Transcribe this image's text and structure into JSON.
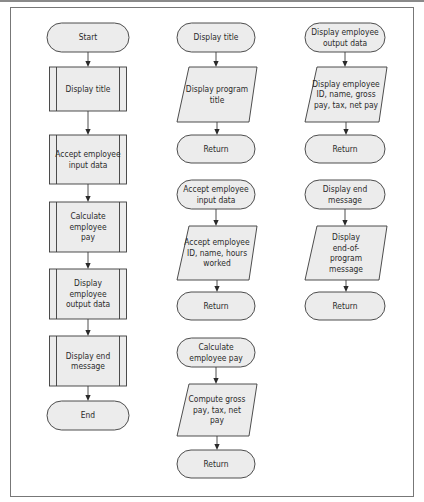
{
  "diagram": {
    "type": "flowchart",
    "columns": [
      {
        "name": "main-program",
        "nodes": [
          {
            "id": "start",
            "kind": "terminal",
            "lines": [
              "Start"
            ]
          },
          {
            "id": "main-display-title",
            "kind": "predefined-process",
            "lines": [
              "Display title"
            ]
          },
          {
            "id": "main-accept-input",
            "kind": "predefined-process",
            "lines": [
              "Accept employee",
              "input data"
            ]
          },
          {
            "id": "main-calculate-pay",
            "kind": "predefined-process",
            "lines": [
              "Calculate",
              "employee",
              "pay"
            ]
          },
          {
            "id": "main-display-output",
            "kind": "predefined-process",
            "lines": [
              "Display",
              "employee",
              "output data"
            ]
          },
          {
            "id": "main-display-end",
            "kind": "predefined-process",
            "lines": [
              "Display end",
              "message"
            ]
          },
          {
            "id": "end",
            "kind": "terminal",
            "lines": [
              "End"
            ]
          }
        ]
      },
      {
        "name": "subroutines-a",
        "nodes": [
          {
            "id": "sub-display-title",
            "kind": "terminal",
            "lines": [
              "Display title"
            ]
          },
          {
            "id": "display-program-title",
            "kind": "io",
            "lines": [
              "Display program",
              "title"
            ]
          },
          {
            "id": "return-1",
            "kind": "terminal",
            "lines": [
              "Return"
            ]
          },
          {
            "id": "sub-accept-input",
            "kind": "terminal",
            "lines": [
              "Accept employee",
              "input data"
            ]
          },
          {
            "id": "accept-id-name-hours",
            "kind": "io",
            "lines": [
              "Accept employee",
              "ID, name, hours",
              "worked"
            ]
          },
          {
            "id": "return-2",
            "kind": "terminal",
            "lines": [
              "Return"
            ]
          },
          {
            "id": "sub-calculate-pay",
            "kind": "terminal",
            "lines": [
              "Calculate",
              "employee pay"
            ]
          },
          {
            "id": "compute-gross-tax-net",
            "kind": "io",
            "lines": [
              "Compute gross",
              "pay, tax, net",
              "pay"
            ]
          },
          {
            "id": "return-3",
            "kind": "terminal",
            "lines": [
              "Return"
            ]
          }
        ]
      },
      {
        "name": "subroutines-b",
        "nodes": [
          {
            "id": "sub-display-output",
            "kind": "terminal",
            "lines": [
              "Display employee",
              "output data"
            ]
          },
          {
            "id": "display-id-name-gross",
            "kind": "io",
            "lines": [
              "Display employee",
              "ID, name, gross",
              "pay, tax, net pay"
            ]
          },
          {
            "id": "return-4",
            "kind": "terminal",
            "lines": [
              "Return"
            ]
          },
          {
            "id": "sub-display-end",
            "kind": "terminal",
            "lines": [
              "Display end",
              "message"
            ]
          },
          {
            "id": "display-end-of-program",
            "kind": "io",
            "lines": [
              "Display",
              "end-of-",
              "program",
              "message"
            ]
          },
          {
            "id": "return-5",
            "kind": "terminal",
            "lines": [
              "Return"
            ]
          }
        ]
      }
    ],
    "edges": [
      [
        "start",
        "main-display-title"
      ],
      [
        "main-display-title",
        "main-accept-input"
      ],
      [
        "main-accept-input",
        "main-calculate-pay"
      ],
      [
        "main-calculate-pay",
        "main-display-output"
      ],
      [
        "main-display-output",
        "main-display-end"
      ],
      [
        "main-display-end",
        "end"
      ],
      [
        "sub-display-title",
        "display-program-title"
      ],
      [
        "display-program-title",
        "return-1"
      ],
      [
        "sub-accept-input",
        "accept-id-name-hours"
      ],
      [
        "accept-id-name-hours",
        "return-2"
      ],
      [
        "sub-calculate-pay",
        "compute-gross-tax-net"
      ],
      [
        "compute-gross-tax-net",
        "return-3"
      ],
      [
        "sub-display-output",
        "display-id-name-gross"
      ],
      [
        "display-id-name-gross",
        "return-4"
      ],
      [
        "sub-display-end",
        "display-end-of-program"
      ],
      [
        "display-end-of-program",
        "return-5"
      ]
    ]
  }
}
